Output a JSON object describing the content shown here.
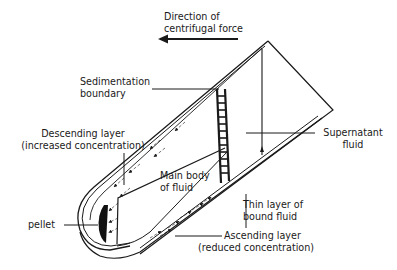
{
  "diagram": {
    "stroke_color": "#1a1a1a",
    "background": "#ffffff",
    "labels": {
      "force": [
        "Direction of",
        "centrifugal force"
      ],
      "sedimentation": [
        "Sedimentation",
        "boundary"
      ],
      "descending": [
        "Descending layer",
        "(increased concentration)"
      ],
      "supernatant": [
        "Supernatant",
        "fluid"
      ],
      "main_body": [
        "Main body",
        "of fluid"
      ],
      "thin_layer": [
        "Thin layer of",
        "bound fluid"
      ],
      "pellet": [
        "pellet"
      ],
      "ascending": [
        "Ascending layer",
        "(reduced concentration)"
      ]
    }
  }
}
